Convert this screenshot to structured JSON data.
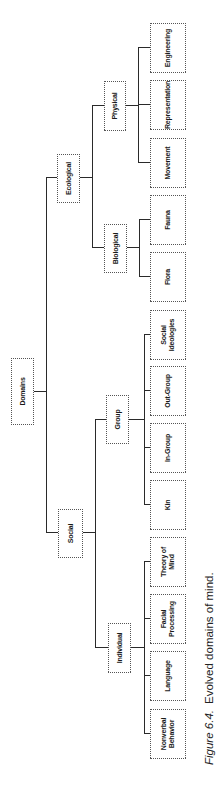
{
  "diagram": {
    "root": "Domains",
    "level1": {
      "social": "Social",
      "ecological": "Ecological"
    },
    "level2": {
      "individual": "Individual",
      "group": "Group",
      "biological": "Biological",
      "physical": "Physical"
    },
    "leaves": {
      "nonverbal_behavior": "Nonverbal Behavior",
      "language": "Language",
      "facial_processing": "Facial Processing",
      "theory_of_mind": "Theory of Mind",
      "kin": "Kin",
      "in_group": "In-Group",
      "out_group": "Out-Group",
      "social_ideologies": "Social Ideologies",
      "flora": "Flora",
      "fauna": "Fauna",
      "movement": "Movement",
      "representation": "Representation",
      "engineering": "Engineering"
    },
    "tree": {
      "Domains": [
        "Social",
        "Ecological"
      ],
      "Social": [
        "Individual",
        "Group"
      ],
      "Ecological": [
        "Biological",
        "Physical"
      ],
      "Individual": [
        "Nonverbal Behavior",
        "Language",
        "Facial Processing",
        "Theory of Mind"
      ],
      "Group": [
        "Kin",
        "In-Group",
        "Out-Group",
        "Social Ideologies"
      ],
      "Biological": [
        "Flora",
        "Fauna"
      ],
      "Physical": [
        "Movement",
        "Representation",
        "Engineering"
      ]
    }
  },
  "caption": {
    "figure_label": "Figure 6.4.",
    "text": "Evolved domains of mind."
  }
}
